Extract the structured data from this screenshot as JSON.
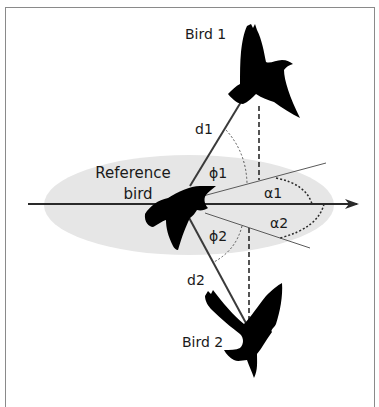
{
  "diagram": {
    "type": "bird-neighbour-geometry",
    "labels": {
      "bird1": "Bird 1",
      "bird2": "Bird 2",
      "reference_line1": "Reference",
      "reference_line2": "bird",
      "d1": "d1",
      "d2": "d2",
      "phi1": "ϕ1",
      "phi2": "ϕ2",
      "alpha1": "α1",
      "alpha2": "α2"
    },
    "colors": {
      "ellipse_fill": "#e6e6e6",
      "line": "#3a3a3a",
      "silhouette": "#000000",
      "frame": "#8a8a8a",
      "text": "#1a1a1a"
    }
  }
}
